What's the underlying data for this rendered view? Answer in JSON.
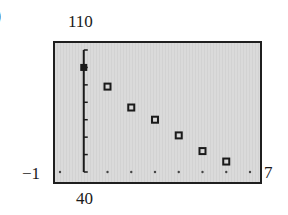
{
  "figure": {
    "part_label": ")",
    "window": {
      "xmin_label": "−1",
      "xmax_label": "7",
      "ymin_label": "40",
      "ymax_label": "110"
    }
  },
  "chart_data": {
    "type": "scatter",
    "title": "",
    "xlabel": "",
    "ylabel": "",
    "xlim": [
      -1,
      7
    ],
    "ylim": [
      40,
      110
    ],
    "x_tick_spacing": 1,
    "y_tick_spacing": 10,
    "grid": false,
    "legend": null,
    "series": [
      {
        "name": "data",
        "marker": "square",
        "x": [
          0,
          1,
          2,
          3,
          4,
          5,
          6
        ],
        "y": [
          100,
          89,
          77,
          70,
          61,
          52,
          46
        ]
      }
    ],
    "annotations": {
      "x_min": "−1",
      "x_max": "7",
      "y_min": "40",
      "y_max": "110"
    },
    "colors": {
      "background": "#d6d6d6",
      "marker": "#1a1a1a",
      "frame": "#1f1f1f"
    }
  }
}
